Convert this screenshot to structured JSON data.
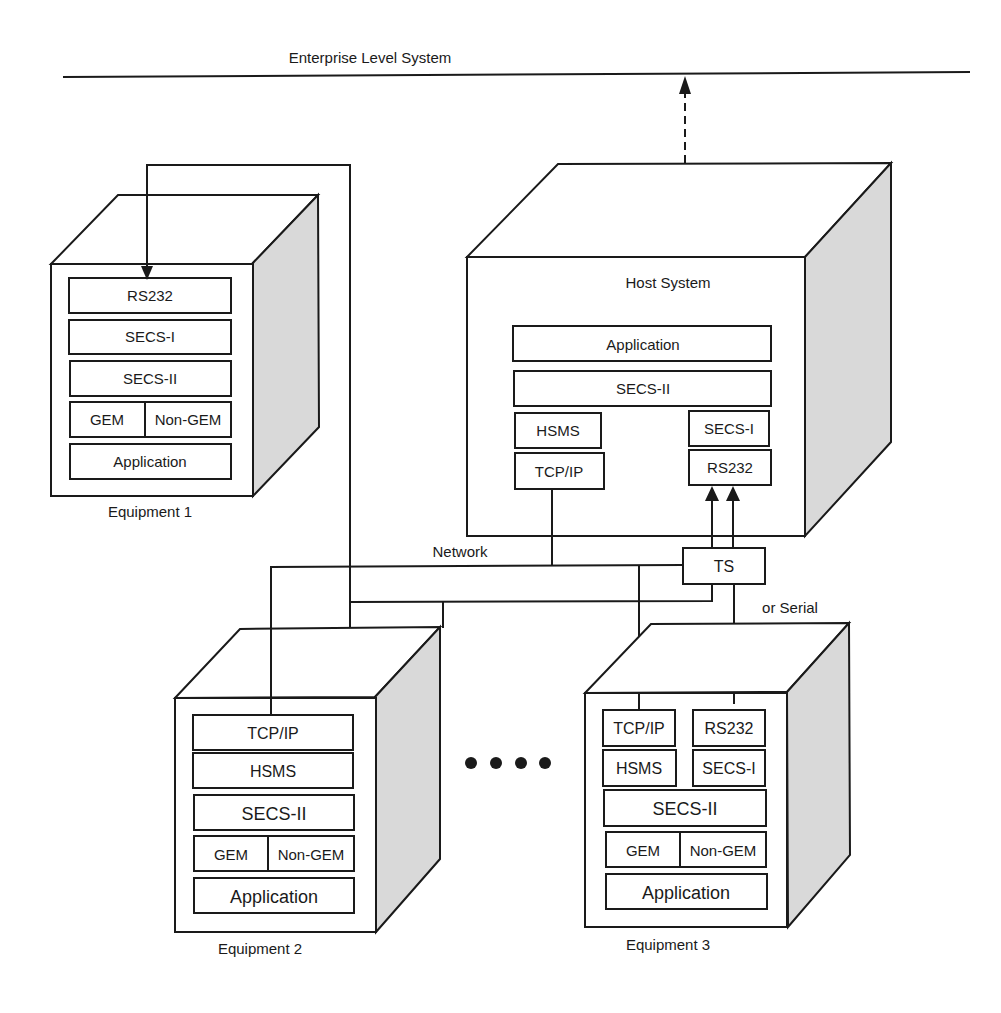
{
  "diagram": {
    "enterprise_label": "Enterprise Level System",
    "network_label": "Network",
    "serial_label": "or Serial",
    "ts_label": "TS",
    "host": {
      "title": "Host System",
      "layers": [
        "Application",
        "SECS-II"
      ],
      "left_stack": [
        "HSMS",
        "TCP/IP"
      ],
      "right_stack": [
        "SECS-I",
        "RS232"
      ]
    },
    "equipment": [
      {
        "name": "Equipment 1",
        "layers": [
          "RS232",
          "SECS-I",
          "SECS-II"
        ],
        "split": [
          "GEM",
          "Non-GEM"
        ],
        "bottom": "Application"
      },
      {
        "name": "Equipment 2",
        "layers": [
          "TCP/IP",
          "HSMS",
          "SECS-II"
        ],
        "split": [
          "GEM",
          "Non-GEM"
        ],
        "bottom": "Application"
      },
      {
        "name": "Equipment 3",
        "left_stack": [
          "TCP/IP",
          "HSMS"
        ],
        "right_stack": [
          "RS232",
          "SECS-I"
        ],
        "layers": [
          "SECS-II"
        ],
        "split": [
          "GEM",
          "Non-GEM"
        ],
        "bottom": "Application"
      }
    ],
    "ellipsis_dots": 4,
    "colors": {
      "line": "#1a1a1a",
      "side_shade": "#d9d9d9",
      "background": "#ffffff"
    }
  }
}
